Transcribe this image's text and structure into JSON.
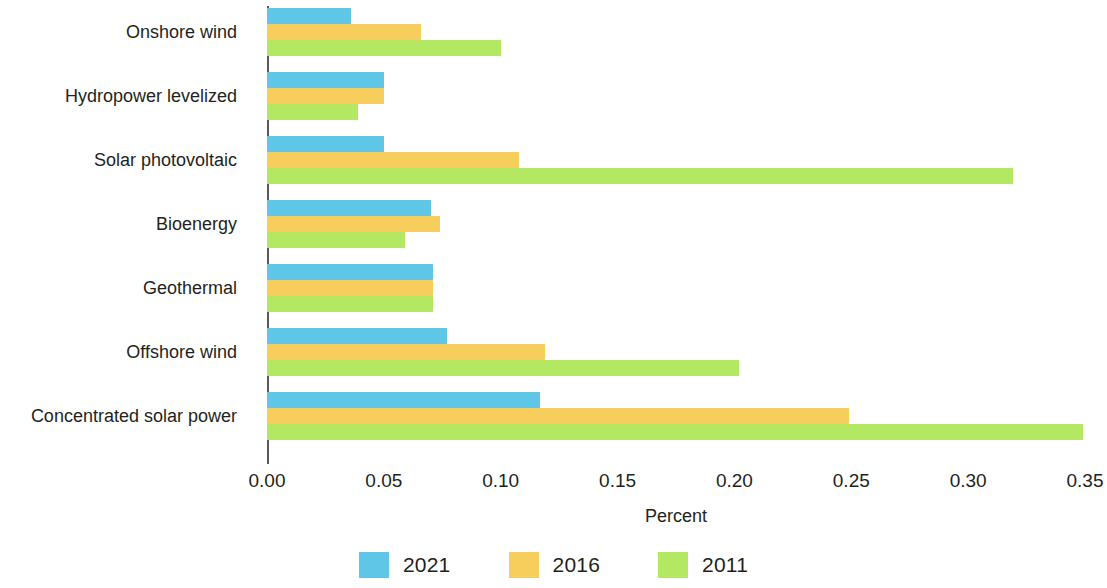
{
  "chart_data": {
    "type": "bar",
    "orientation": "horizontal",
    "title": "",
    "xlabel": "Percent",
    "ylabel": "",
    "xlim": [
      0.0,
      0.35
    ],
    "xticks": [
      "0.00",
      "0.05",
      "0.10",
      "0.15",
      "0.20",
      "0.25",
      "0.30",
      "0.35"
    ],
    "xtick_values": [
      0.0,
      0.05,
      0.1,
      0.15,
      0.2,
      0.25,
      0.3,
      0.35
    ],
    "grid": false,
    "legend_position": "bottom",
    "categories": [
      "Onshore wind",
      "Hydropower levelized",
      "Solar photovoltaic",
      "Bioenergy",
      "Geothermal",
      "Offshore wind",
      "Concentrated solar power"
    ],
    "series": [
      {
        "name": "2021",
        "color": "#5FC6E8",
        "values": [
          0.036,
          0.05,
          0.05,
          0.07,
          0.071,
          0.077,
          0.117
        ]
      },
      {
        "name": "2016",
        "color": "#F7CE5B",
        "values": [
          0.066,
          0.05,
          0.108,
          0.074,
          0.071,
          0.119,
          0.249
        ]
      },
      {
        "name": "2011",
        "color": "#B4E863",
        "values": [
          0.1,
          0.039,
          0.319,
          0.059,
          0.071,
          0.202,
          0.349
        ]
      }
    ]
  },
  "legend": {
    "items": [
      {
        "label": "2021",
        "color": "#5FC6E8"
      },
      {
        "label": "2016",
        "color": "#F7CE5B"
      },
      {
        "label": "2011",
        "color": "#B4E863"
      }
    ]
  },
  "axis": {
    "x_title": "Percent",
    "axis_color": "#58595b"
  }
}
